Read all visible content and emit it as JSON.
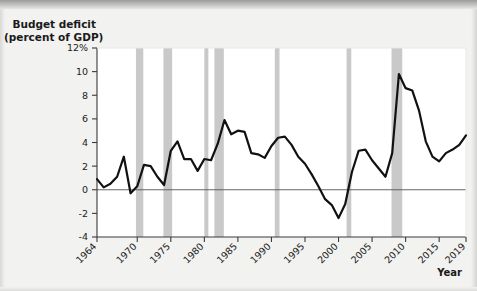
{
  "chart_data": {
    "type": "line",
    "title": "Budget deficit (percent of GDP)",
    "title_line1": "Budget deficit",
    "title_line2": "(percent of GDP)",
    "xlabel": "Year",
    "ylabel": "",
    "xlim": [
      1964,
      2019
    ],
    "ylim": [
      -4,
      12
    ],
    "yticks": [
      -4,
      -2,
      0,
      2,
      4,
      6,
      8,
      10,
      12
    ],
    "ytick_labels": [
      "-4",
      "-2",
      "0",
      "2",
      "4",
      "6",
      "8",
      "10",
      "12%"
    ],
    "xticks": [
      1964,
      1970,
      1975,
      1980,
      1985,
      1990,
      1995,
      2000,
      2005,
      2010,
      2015,
      2019
    ],
    "xtick_labels": [
      "1964",
      "1970",
      "1975",
      "1980",
      "1985",
      "1990",
      "1995",
      "2000",
      "2005",
      "2010",
      "2015",
      "2019"
    ],
    "grid": false,
    "legend": "none",
    "zero_line": 0,
    "line_color": "#111111",
    "line_width": 2.2,
    "band_color": "#c9c9c9",
    "plot_bg": "#ffffff",
    "axis_color": "#3a3a3a",
    "recession_bands": [
      {
        "start": 1969.8,
        "end": 1970.9
      },
      {
        "start": 1973.9,
        "end": 1975.2
      },
      {
        "start": 1980.0,
        "end": 1980.6
      },
      {
        "start": 1981.5,
        "end": 1982.9
      },
      {
        "start": 1990.5,
        "end": 1991.2
      },
      {
        "start": 2001.2,
        "end": 2001.9
      },
      {
        "start": 2007.9,
        "end": 2009.5
      }
    ],
    "x": [
      1964,
      1965,
      1966,
      1967,
      1968,
      1969,
      1970,
      1971,
      1972,
      1973,
      1974,
      1975,
      1976,
      1977,
      1978,
      1979,
      1980,
      1981,
      1982,
      1983,
      1984,
      1985,
      1986,
      1987,
      1988,
      1989,
      1990,
      1991,
      1992,
      1993,
      1994,
      1995,
      1996,
      1997,
      1998,
      1999,
      2000,
      2001,
      2002,
      2003,
      2004,
      2005,
      2006,
      2007,
      2008,
      2009,
      2010,
      2011,
      2012,
      2013,
      2014,
      2015,
      2016,
      2017,
      2018,
      2019
    ],
    "values": [
      0.9,
      0.2,
      0.5,
      1.1,
      2.8,
      -0.3,
      0.3,
      2.1,
      2.0,
      1.1,
      0.4,
      3.3,
      4.1,
      2.6,
      2.6,
      1.6,
      2.6,
      2.5,
      3.9,
      5.9,
      4.7,
      5.0,
      4.9,
      3.1,
      3.0,
      2.7,
      3.7,
      4.4,
      4.5,
      3.8,
      2.8,
      2.2,
      1.3,
      0.3,
      -0.8,
      -1.3,
      -2.4,
      -1.2,
      1.5,
      3.3,
      3.4,
      2.5,
      1.8,
      1.1,
      3.1,
      9.8,
      8.6,
      8.4,
      6.7,
      4.1,
      2.8,
      2.4,
      3.1,
      3.4,
      3.8,
      4.6
    ]
  }
}
